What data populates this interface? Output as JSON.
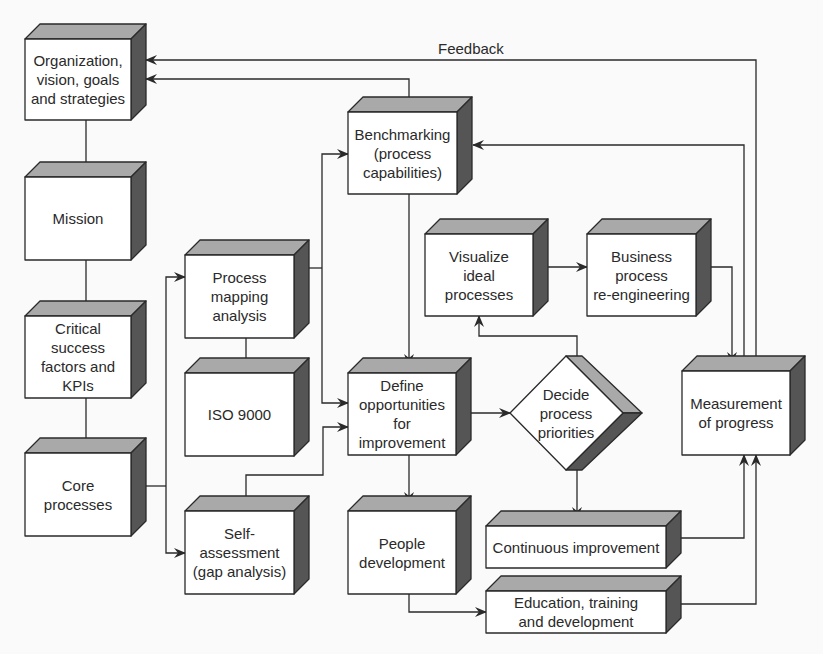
{
  "colors": {
    "background": "#fafafa",
    "face": "#ffffff",
    "top": "#a9a9a9",
    "side": "#555555",
    "line": "#2a2a2a"
  },
  "labels": {
    "feedback": "Feedback"
  },
  "nodes": [
    {
      "id": "org",
      "label": "Organization,\nvision, goals\nand strategies"
    },
    {
      "id": "mission",
      "label": "Mission"
    },
    {
      "id": "csf",
      "label": "Critical\nsuccess\nfactors and\nKPIs"
    },
    {
      "id": "core",
      "label": "Core\nprocesses"
    },
    {
      "id": "pma",
      "label": "Process\nmapping\nanalysis"
    },
    {
      "id": "iso",
      "label": "ISO 9000"
    },
    {
      "id": "self",
      "label": "Self-\nassessment\n(gap analysis)"
    },
    {
      "id": "bench",
      "label": "Benchmarking\n(process\ncapabilities)"
    },
    {
      "id": "define",
      "label": "Define\nopportunities\nfor\nimprovement"
    },
    {
      "id": "people",
      "label": "People\ndevelopment"
    },
    {
      "id": "visualize",
      "label": "Visualize\nideal\nprocesses"
    },
    {
      "id": "bpr",
      "label": "Business\nprocess\nre-engineering"
    },
    {
      "id": "decide",
      "label": "Decide\nprocess\npriorities"
    },
    {
      "id": "measure",
      "label": "Measurement\nof progress"
    },
    {
      "id": "ci",
      "label": "Continuous improvement"
    },
    {
      "id": "edu",
      "label": "Education, training\nand development"
    }
  ],
  "edges": [
    {
      "from": "org",
      "to": "mission"
    },
    {
      "from": "mission",
      "to": "csf"
    },
    {
      "from": "csf",
      "to": "core"
    },
    {
      "from": "core",
      "to": "pma"
    },
    {
      "from": "core",
      "to": "self"
    },
    {
      "from": "pma",
      "to": "iso",
      "arrow": false
    },
    {
      "from": "pma",
      "to": "bench"
    },
    {
      "from": "pma",
      "to": "define"
    },
    {
      "from": "self",
      "to": "define"
    },
    {
      "from": "bench",
      "to": "org"
    },
    {
      "from": "bench",
      "to": "define"
    },
    {
      "from": "define",
      "to": "decide"
    },
    {
      "from": "define",
      "to": "people"
    },
    {
      "from": "decide",
      "to": "visualize"
    },
    {
      "from": "decide",
      "to": "ci"
    },
    {
      "from": "visualize",
      "to": "bpr"
    },
    {
      "from": "bpr",
      "to": "measure"
    },
    {
      "from": "measure",
      "to": "bench"
    },
    {
      "from": "measure",
      "to": "org",
      "label": "Feedback"
    },
    {
      "from": "people",
      "to": "edu"
    },
    {
      "from": "ci",
      "to": "measure"
    },
    {
      "from": "edu",
      "to": "measure"
    }
  ]
}
